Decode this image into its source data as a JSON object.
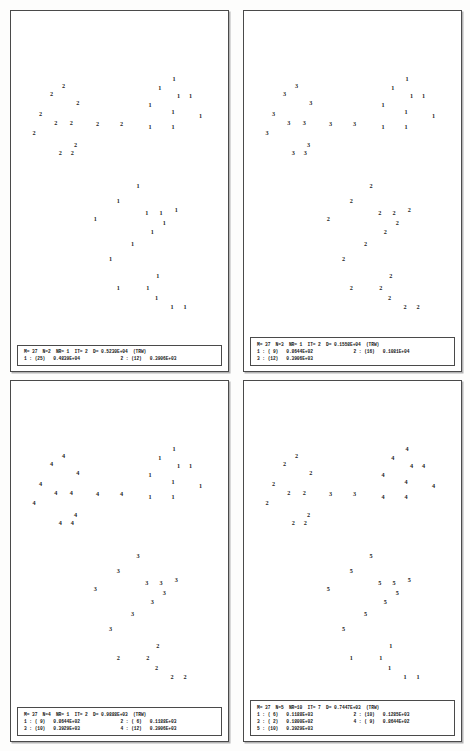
{
  "document": {
    "title": "Cluster analysis scatter plots",
    "panel_count": 4
  },
  "panels": [
    {
      "id": "panel-1",
      "header": "M= 37  N=2  NR= 1  IT= 2  D= 0.5230E+04  (TRW)",
      "header_fields": {
        "M": "37",
        "N": "2",
        "NR": "1",
        "IT": "2",
        "D": "0.5230E+04",
        "criterion": "(TRW)"
      },
      "clusters": [
        {
          "index": "1",
          "count": "25",
          "value": "0.4839E+04",
          "text": "1 : (25)   0.4839E+04"
        },
        {
          "index": "2",
          "count": "12",
          "value": "0.3906E+03",
          "text": "2 : (12)   0.3906E+03"
        }
      ],
      "footer_rows": [
        [
          "1 : (25)   0.4839E+04",
          "2 : (12)   0.3906E+03"
        ]
      ],
      "points": [
        {
          "label": "2",
          "x": 18.5,
          "y": 37.5
        },
        {
          "label": "2",
          "x": 24.0,
          "y": 34.0
        },
        {
          "label": "2",
          "x": 30.5,
          "y": 42.0
        },
        {
          "label": "2",
          "x": 13.5,
          "y": 47.0
        },
        {
          "label": "2",
          "x": 20.5,
          "y": 51.0
        },
        {
          "label": "2",
          "x": 27.5,
          "y": 51.0
        },
        {
          "label": "2",
          "x": 10.5,
          "y": 55.5
        },
        {
          "label": "2",
          "x": 39.5,
          "y": 51.5
        },
        {
          "label": "2",
          "x": 50.5,
          "y": 51.5
        },
        {
          "label": "2",
          "x": 29.5,
          "y": 61.0
        },
        {
          "label": "2",
          "x": 22.5,
          "y": 64.5
        },
        {
          "label": "2",
          "x": 28.0,
          "y": 64.5
        },
        {
          "label": "1",
          "x": 74.5,
          "y": 31.0
        },
        {
          "label": "1",
          "x": 68.0,
          "y": 35.0
        },
        {
          "label": "1",
          "x": 76.5,
          "y": 38.5
        },
        {
          "label": "1",
          "x": 82.0,
          "y": 38.5
        },
        {
          "label": "1",
          "x": 63.5,
          "y": 42.5
        },
        {
          "label": "1",
          "x": 74.0,
          "y": 46.0
        },
        {
          "label": "1",
          "x": 86.5,
          "y": 47.5
        },
        {
          "label": "1",
          "x": 63.5,
          "y": 52.5
        },
        {
          "label": "1",
          "x": 74.0,
          "y": 52.5
        },
        {
          "label": "1",
          "x": 58.0,
          "y": 79.5
        },
        {
          "label": "1",
          "x": 49.0,
          "y": 86.5
        },
        {
          "label": "1",
          "x": 62.0,
          "y": 92.0
        },
        {
          "label": "1",
          "x": 68.5,
          "y": 92.0
        },
        {
          "label": "1",
          "x": 75.5,
          "y": 90.5
        },
        {
          "label": "1",
          "x": 38.5,
          "y": 94.5
        },
        {
          "label": "1",
          "x": 70.0,
          "y": 96.5
        },
        {
          "label": "1",
          "x": 64.5,
          "y": 100.5
        },
        {
          "label": "1",
          "x": 55.5,
          "y": 106.0
        },
        {
          "label": "1",
          "x": 45.5,
          "y": 112.5
        },
        {
          "label": "1",
          "x": 67.0,
          "y": 120.5
        },
        {
          "label": "1",
          "x": 49.0,
          "y": 126.0
        },
        {
          "label": "1",
          "x": 62.5,
          "y": 126.0
        },
        {
          "label": "1",
          "x": 66.5,
          "y": 130.5
        },
        {
          "label": "1",
          "x": 73.5,
          "y": 134.5
        },
        {
          "label": "1",
          "x": 79.5,
          "y": 134.5
        }
      ]
    },
    {
      "id": "panel-2",
      "header": "M= 37  N=3  NR= 1  IT= 2  D= 0.1558E+04  (TRW)",
      "header_fields": {
        "M": "37",
        "N": "3",
        "NR": "1",
        "IT": "2",
        "D": "0.1558E+04",
        "criterion": "(TRW)"
      },
      "clusters": [
        {
          "index": "1",
          "count": "9",
          "value": "0.8644E+02",
          "text": "1 : ( 9)   0.8644E+02"
        },
        {
          "index": "2",
          "count": "16",
          "value": "0.1081E+04",
          "text": "2 : (16)   0.1081E+04"
        },
        {
          "index": "3",
          "count": "12",
          "value": "0.3906E+03",
          "text": "3 : (12)   0.3906E+03"
        }
      ],
      "footer_rows": [
        [
          "1 : ( 9)   0.8644E+02",
          "2 : (16)   0.1081E+04"
        ],
        [
          "3 : (12)   0.3906E+03",
          ""
        ]
      ],
      "points": [
        {
          "label": "3",
          "x": 18.5,
          "y": 37.5
        },
        {
          "label": "3",
          "x": 24.0,
          "y": 34.0
        },
        {
          "label": "3",
          "x": 30.5,
          "y": 42.0
        },
        {
          "label": "3",
          "x": 13.5,
          "y": 47.0
        },
        {
          "label": "3",
          "x": 20.5,
          "y": 51.0
        },
        {
          "label": "3",
          "x": 27.5,
          "y": 51.0
        },
        {
          "label": "3",
          "x": 10.5,
          "y": 55.5
        },
        {
          "label": "3",
          "x": 39.5,
          "y": 51.5
        },
        {
          "label": "3",
          "x": 50.5,
          "y": 51.5
        },
        {
          "label": "3",
          "x": 29.5,
          "y": 61.0
        },
        {
          "label": "3",
          "x": 22.5,
          "y": 64.5
        },
        {
          "label": "3",
          "x": 28.0,
          "y": 64.5
        },
        {
          "label": "1",
          "x": 74.5,
          "y": 31.0
        },
        {
          "label": "1",
          "x": 68.0,
          "y": 35.0
        },
        {
          "label": "1",
          "x": 76.5,
          "y": 38.5
        },
        {
          "label": "1",
          "x": 82.0,
          "y": 38.5
        },
        {
          "label": "1",
          "x": 63.5,
          "y": 42.5
        },
        {
          "label": "1",
          "x": 74.0,
          "y": 46.0
        },
        {
          "label": "1",
          "x": 86.5,
          "y": 47.5
        },
        {
          "label": "1",
          "x": 63.5,
          "y": 52.5
        },
        {
          "label": "1",
          "x": 74.0,
          "y": 52.5
        },
        {
          "label": "2",
          "x": 58.0,
          "y": 79.5
        },
        {
          "label": "2",
          "x": 49.0,
          "y": 86.5
        },
        {
          "label": "2",
          "x": 62.0,
          "y": 92.0
        },
        {
          "label": "2",
          "x": 68.5,
          "y": 92.0
        },
        {
          "label": "2",
          "x": 75.5,
          "y": 90.5
        },
        {
          "label": "2",
          "x": 38.5,
          "y": 94.5
        },
        {
          "label": "2",
          "x": 70.0,
          "y": 96.5
        },
        {
          "label": "2",
          "x": 64.5,
          "y": 100.5
        },
        {
          "label": "2",
          "x": 55.5,
          "y": 106.0
        },
        {
          "label": "2",
          "x": 45.5,
          "y": 112.5
        },
        {
          "label": "2",
          "x": 67.0,
          "y": 120.5
        },
        {
          "label": "2",
          "x": 49.0,
          "y": 126.0
        },
        {
          "label": "2",
          "x": 62.5,
          "y": 126.0
        },
        {
          "label": "2",
          "x": 66.5,
          "y": 130.5
        },
        {
          "label": "2",
          "x": 73.5,
          "y": 134.5
        },
        {
          "label": "2",
          "x": 79.5,
          "y": 134.5
        }
      ]
    },
    {
      "id": "panel-3",
      "header": "M= 37  N=4  NR= 1  IT= 2  D= 0.9888E+03  (TRW)",
      "header_fields": {
        "M": "37",
        "N": "4",
        "NR": "1",
        "IT": "2",
        "D": "0.9888E+03",
        "criterion": "(TRW)"
      },
      "clusters": [
        {
          "index": "1",
          "count": "9",
          "value": "0.8644E+02",
          "text": "1 : ( 9)   0.8644E+02"
        },
        {
          "index": "2",
          "count": "6",
          "value": "0.1188E+03",
          "text": "2 : ( 6)   0.1188E+03"
        },
        {
          "index": "3",
          "count": "10",
          "value": "0.3929E+03",
          "text": "3 : (10)   0.3929E+03"
        },
        {
          "index": "4",
          "count": "12",
          "value": "0.3906E+03",
          "text": "4 : (12)   0.3906E+03"
        }
      ],
      "footer_rows": [
        [
          "1 : ( 9)   0.8644E+02",
          "2 : ( 6)   0.1188E+03"
        ],
        [
          "3 : (10)   0.3929E+03",
          "4 : (12)   0.3906E+03"
        ]
      ],
      "points": [
        {
          "label": "4",
          "x": 18.5,
          "y": 37.5
        },
        {
          "label": "4",
          "x": 24.0,
          "y": 34.0
        },
        {
          "label": "4",
          "x": 30.5,
          "y": 42.0
        },
        {
          "label": "4",
          "x": 13.5,
          "y": 47.0
        },
        {
          "label": "4",
          "x": 20.5,
          "y": 51.0
        },
        {
          "label": "4",
          "x": 27.5,
          "y": 51.0
        },
        {
          "label": "4",
          "x": 10.5,
          "y": 55.5
        },
        {
          "label": "4",
          "x": 39.5,
          "y": 51.5
        },
        {
          "label": "4",
          "x": 50.5,
          "y": 51.5
        },
        {
          "label": "4",
          "x": 29.5,
          "y": 61.0
        },
        {
          "label": "4",
          "x": 22.5,
          "y": 64.5
        },
        {
          "label": "4",
          "x": 28.0,
          "y": 64.5
        },
        {
          "label": "1",
          "x": 74.5,
          "y": 31.0
        },
        {
          "label": "1",
          "x": 68.0,
          "y": 35.0
        },
        {
          "label": "1",
          "x": 76.5,
          "y": 38.5
        },
        {
          "label": "1",
          "x": 82.0,
          "y": 38.5
        },
        {
          "label": "1",
          "x": 63.5,
          "y": 42.5
        },
        {
          "label": "1",
          "x": 74.0,
          "y": 46.0
        },
        {
          "label": "1",
          "x": 86.5,
          "y": 47.5
        },
        {
          "label": "1",
          "x": 63.5,
          "y": 52.5
        },
        {
          "label": "1",
          "x": 74.0,
          "y": 52.5
        },
        {
          "label": "3",
          "x": 58.0,
          "y": 79.5
        },
        {
          "label": "3",
          "x": 49.0,
          "y": 86.5
        },
        {
          "label": "3",
          "x": 62.0,
          "y": 92.0
        },
        {
          "label": "3",
          "x": 68.5,
          "y": 92.0
        },
        {
          "label": "3",
          "x": 75.5,
          "y": 90.5
        },
        {
          "label": "3",
          "x": 38.5,
          "y": 94.5
        },
        {
          "label": "3",
          "x": 70.0,
          "y": 96.5
        },
        {
          "label": "3",
          "x": 64.5,
          "y": 100.5
        },
        {
          "label": "3",
          "x": 55.5,
          "y": 106.0
        },
        {
          "label": "3",
          "x": 45.5,
          "y": 112.5
        },
        {
          "label": "2",
          "x": 67.0,
          "y": 120.5
        },
        {
          "label": "2",
          "x": 49.0,
          "y": 126.0
        },
        {
          "label": "2",
          "x": 62.5,
          "y": 126.0
        },
        {
          "label": "2",
          "x": 66.5,
          "y": 130.5
        },
        {
          "label": "2",
          "x": 73.5,
          "y": 134.5
        },
        {
          "label": "2",
          "x": 79.5,
          "y": 134.5
        }
      ]
    },
    {
      "id": "panel-4",
      "header": "M= 37  N=5  NR=10  IT= 7  D= 0.7447E+03  (TRW)",
      "header_fields": {
        "M": "37",
        "N": "5",
        "NR": "10",
        "IT": "7",
        "D": "0.7447E+03",
        "criterion": "(TRW)"
      },
      "clusters": [
        {
          "index": "1",
          "count": "6",
          "value": "0.1188E+03",
          "text": "1 : ( 6)   0.1188E+03"
        },
        {
          "index": "2",
          "count": "10",
          "value": "0.1285E+03",
          "text": "2 : (10)   0.1285E+03"
        },
        {
          "index": "3",
          "count": "2",
          "value": "0.1800E+02",
          "text": "3 : ( 2)   0.1800E+02"
        },
        {
          "index": "4",
          "count": "9",
          "value": "0.8644E+02",
          "text": "4 : ( 9)   0.8644E+02"
        },
        {
          "index": "5",
          "count": "10",
          "value": "0.3929E+03",
          "text": "5 : (10)   0.3929E+03"
        }
      ],
      "footer_rows": [
        [
          "1 : ( 6)   0.1188E+03",
          "2 : (10)   0.1285E+03"
        ],
        [
          "3 : ( 2)   0.1800E+02",
          "4 : ( 9)   0.8644E+02"
        ],
        [
          "5 : (10)   0.3929E+03",
          ""
        ]
      ],
      "points": [
        {
          "label": "2",
          "x": 18.5,
          "y": 37.5
        },
        {
          "label": "2",
          "x": 24.0,
          "y": 34.0
        },
        {
          "label": "2",
          "x": 30.5,
          "y": 42.0
        },
        {
          "label": "2",
          "x": 13.5,
          "y": 47.0
        },
        {
          "label": "2",
          "x": 20.5,
          "y": 51.0
        },
        {
          "label": "2",
          "x": 27.5,
          "y": 51.0
        },
        {
          "label": "2",
          "x": 10.5,
          "y": 55.5
        },
        {
          "label": "3",
          "x": 39.5,
          "y": 51.5
        },
        {
          "label": "3",
          "x": 50.5,
          "y": 51.5
        },
        {
          "label": "2",
          "x": 29.5,
          "y": 61.0
        },
        {
          "label": "2",
          "x": 22.5,
          "y": 64.5
        },
        {
          "label": "2",
          "x": 28.0,
          "y": 64.5
        },
        {
          "label": "4",
          "x": 74.5,
          "y": 31.0
        },
        {
          "label": "4",
          "x": 68.0,
          "y": 35.0
        },
        {
          "label": "4",
          "x": 76.5,
          "y": 38.5
        },
        {
          "label": "4",
          "x": 82.0,
          "y": 38.5
        },
        {
          "label": "4",
          "x": 63.5,
          "y": 42.5
        },
        {
          "label": "4",
          "x": 74.0,
          "y": 46.0
        },
        {
          "label": "4",
          "x": 86.5,
          "y": 47.5
        },
        {
          "label": "4",
          "x": 63.5,
          "y": 52.5
        },
        {
          "label": "4",
          "x": 74.0,
          "y": 52.5
        },
        {
          "label": "5",
          "x": 58.0,
          "y": 79.5
        },
        {
          "label": "5",
          "x": 49.0,
          "y": 86.5
        },
        {
          "label": "5",
          "x": 62.0,
          "y": 92.0
        },
        {
          "label": "5",
          "x": 68.5,
          "y": 92.0
        },
        {
          "label": "5",
          "x": 75.5,
          "y": 90.5
        },
        {
          "label": "5",
          "x": 38.5,
          "y": 94.5
        },
        {
          "label": "5",
          "x": 70.0,
          "y": 96.5
        },
        {
          "label": "5",
          "x": 64.5,
          "y": 100.5
        },
        {
          "label": "5",
          "x": 55.5,
          "y": 106.0
        },
        {
          "label": "5",
          "x": 45.5,
          "y": 112.5
        },
        {
          "label": "1",
          "x": 67.0,
          "y": 120.5
        },
        {
          "label": "1",
          "x": 49.0,
          "y": 126.0
        },
        {
          "label": "1",
          "x": 62.5,
          "y": 126.0
        },
        {
          "label": "1",
          "x": 66.5,
          "y": 130.5
        },
        {
          "label": "1",
          "x": 73.5,
          "y": 134.5
        },
        {
          "label": "1",
          "x": 79.5,
          "y": 134.5
        }
      ]
    }
  ],
  "chart_data": {
    "type": "scatter",
    "xlabel": "",
    "ylabel": "",
    "grid": false,
    "legend": "none",
    "n_points": 37,
    "panels": [
      {
        "name": "N=2",
        "criterion_value": 5230.0,
        "criterion_label": "0.5230E+04",
        "iterations": 2,
        "restarts": 1,
        "series": [
          {
            "name": "cluster 1",
            "count": 25,
            "within_ss": 4839.0
          },
          {
            "name": "cluster 2",
            "count": 12,
            "within_ss": 390.6
          }
        ]
      },
      {
        "name": "N=3",
        "criterion_value": 1558.0,
        "criterion_label": "0.1558E+04",
        "iterations": 2,
        "restarts": 1,
        "series": [
          {
            "name": "cluster 1",
            "count": 9,
            "within_ss": 86.44
          },
          {
            "name": "cluster 2",
            "count": 16,
            "within_ss": 1081.0
          },
          {
            "name": "cluster 3",
            "count": 12,
            "within_ss": 390.6
          }
        ]
      },
      {
        "name": "N=4",
        "criterion_value": 988.8,
        "criterion_label": "0.9888E+03",
        "iterations": 2,
        "restarts": 1,
        "series": [
          {
            "name": "cluster 1",
            "count": 9,
            "within_ss": 86.44
          },
          {
            "name": "cluster 2",
            "count": 6,
            "within_ss": 118.8
          },
          {
            "name": "cluster 3",
            "count": 10,
            "within_ss": 392.9
          },
          {
            "name": "cluster 4",
            "count": 12,
            "within_ss": 390.6
          }
        ]
      },
      {
        "name": "N=5",
        "criterion_value": 744.7,
        "criterion_label": "0.7447E+03",
        "iterations": 7,
        "restarts": 10,
        "series": [
          {
            "name": "cluster 1",
            "count": 6,
            "within_ss": 118.8
          },
          {
            "name": "cluster 2",
            "count": 10,
            "within_ss": 128.5
          },
          {
            "name": "cluster 3",
            "count": 2,
            "within_ss": 18.0
          },
          {
            "name": "cluster 4",
            "count": 9,
            "within_ss": 86.44
          },
          {
            "name": "cluster 5",
            "count": 10,
            "within_ss": 392.9
          }
        ]
      }
    ]
  }
}
